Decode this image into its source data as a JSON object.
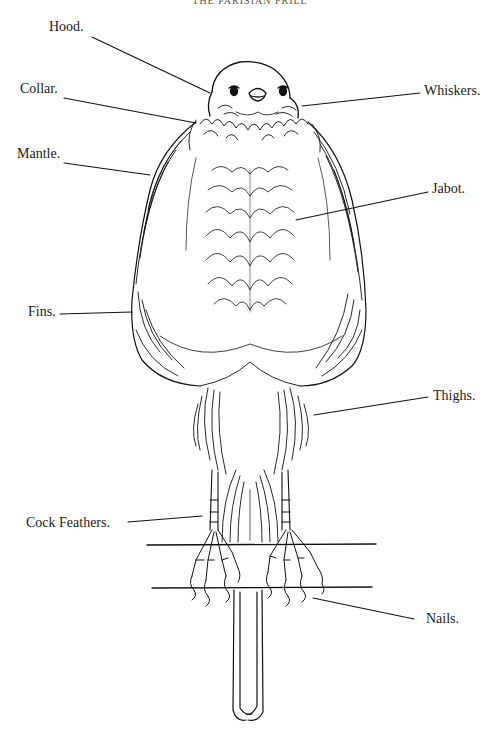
{
  "page": {
    "running_head": "THE PARISIAN FRILL"
  },
  "diagram": {
    "labels": [
      {
        "id": "hood",
        "text": "Hood."
      },
      {
        "id": "collar",
        "text": "Collar."
      },
      {
        "id": "mantle",
        "text": "Mantle."
      },
      {
        "id": "whiskers",
        "text": "Whiskers."
      },
      {
        "id": "jabot",
        "text": "Jabot."
      },
      {
        "id": "fins",
        "text": "Fins."
      },
      {
        "id": "thighs",
        "text": "Thighs."
      },
      {
        "id": "cock_feathers",
        "text": "Cock Feathers."
      },
      {
        "id": "nails",
        "text": "Nails."
      }
    ]
  },
  "colors": {
    "ink": "#111111",
    "paper": "#ffffff"
  }
}
